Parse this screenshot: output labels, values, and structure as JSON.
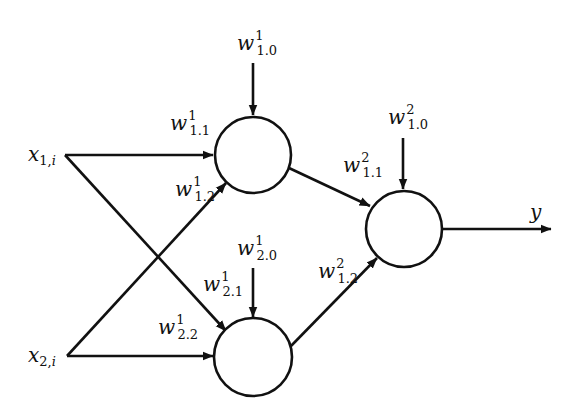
{
  "diagram": {
    "type": "neural-network",
    "title": "",
    "colors": {
      "stroke": "#111111",
      "background": "#ffffff",
      "node_fill": "#ffffff"
    },
    "inputs": [
      {
        "id": "x1",
        "symbol": "x",
        "sub": "1,",
        "sub_it": "i"
      },
      {
        "id": "x2",
        "symbol": "x",
        "sub": "2,",
        "sub_it": "i"
      }
    ],
    "nodes": [
      {
        "id": "hidden-1",
        "layer": 1
      },
      {
        "id": "hidden-2",
        "layer": 1
      },
      {
        "id": "output-1",
        "layer": 2
      }
    ],
    "output": {
      "symbol": "y"
    },
    "weights": {
      "w1_10": {
        "symbol": "w",
        "sup": "1",
        "sub": "1.0",
        "role": "bias to hidden-1"
      },
      "w1_11": {
        "symbol": "w",
        "sup": "1",
        "sub": "1.1",
        "role": "x1 to hidden-1"
      },
      "w1_12": {
        "symbol": "w",
        "sup": "1",
        "sub": "1.2",
        "role": "x2 to hidden-1"
      },
      "w1_20": {
        "symbol": "w",
        "sup": "1",
        "sub": "2.0",
        "role": "bias to hidden-2"
      },
      "w1_21": {
        "symbol": "w",
        "sup": "1",
        "sub": "2.1",
        "role": "x1 to hidden-2"
      },
      "w1_22": {
        "symbol": "w",
        "sup": "1",
        "sub": "2.2",
        "role": "x2 to hidden-2"
      },
      "w2_10": {
        "symbol": "w",
        "sup": "2",
        "sub": "1.0",
        "role": "bias to output"
      },
      "w2_11": {
        "symbol": "w",
        "sup": "2",
        "sub": "1.1",
        "role": "hidden-1 to output"
      },
      "w2_12": {
        "symbol": "w",
        "sup": "2",
        "sub": "1.2",
        "role": "hidden-2 to output"
      }
    },
    "edges": [
      {
        "from": "x1",
        "to": "hidden-1",
        "weight": "w1_11"
      },
      {
        "from": "x1",
        "to": "hidden-2",
        "weight": "w1_21"
      },
      {
        "from": "x2",
        "to": "hidden-1",
        "weight": "w1_12"
      },
      {
        "from": "x2",
        "to": "hidden-2",
        "weight": "w1_22"
      },
      {
        "from": "bias",
        "to": "hidden-1",
        "weight": "w1_10"
      },
      {
        "from": "bias",
        "to": "hidden-2",
        "weight": "w1_20"
      },
      {
        "from": "hidden-1",
        "to": "output-1",
        "weight": "w2_11"
      },
      {
        "from": "hidden-2",
        "to": "output-1",
        "weight": "w2_12"
      },
      {
        "from": "bias",
        "to": "output-1",
        "weight": "w2_10"
      },
      {
        "from": "output-1",
        "to": "y",
        "weight": null
      }
    ]
  }
}
